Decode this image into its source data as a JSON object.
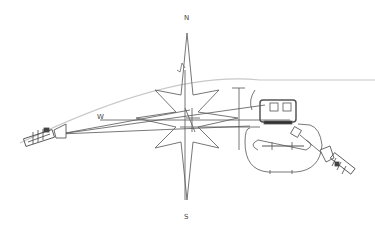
{
  "diagram": {
    "type": "technical-line-drawing",
    "compass_labels": {
      "north": "N",
      "south": "S",
      "west": "W"
    },
    "colors": {
      "line": "#555555",
      "light_line": "#bbbbbb",
      "background": "#ffffff"
    },
    "elements": [
      {
        "name": "compass-rose",
        "desc": "eight-pointed star compass"
      },
      {
        "name": "left-device",
        "desc": "cylindrical instrument on left with cone"
      },
      {
        "name": "right-device",
        "desc": "cylindrical instrument on lower right"
      },
      {
        "name": "structure",
        "desc": "rounded enclosure with box and rails"
      },
      {
        "name": "arc-line",
        "desc": "light trajectory curve"
      }
    ]
  }
}
